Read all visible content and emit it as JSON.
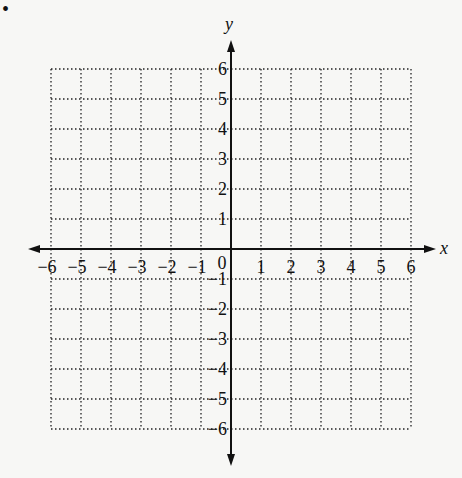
{
  "bullet": "•",
  "axes": {
    "x_label": "x",
    "y_label": "y"
  },
  "chart_data": {
    "type": "coordinate-grid",
    "title": "",
    "xlabel": "x",
    "ylabel": "y",
    "xlim": [
      -6,
      6
    ],
    "ylim": [
      -6,
      6
    ],
    "grid": "dotted",
    "x_ticks": [
      "-6",
      "-5",
      "-4",
      "-3",
      "-2",
      "-1",
      "0",
      "1",
      "2",
      "3",
      "4",
      "5",
      "6"
    ],
    "y_ticks": [
      "6",
      "5",
      "4",
      "3",
      "2",
      "1",
      "-1",
      "-2",
      "-3",
      "-4",
      "-5",
      "-6"
    ]
  },
  "x_tick_labels": [
    "−6",
    "−5",
    "−4",
    "−3",
    "−2",
    "−1",
    "1",
    "2",
    "3",
    "4",
    "5",
    "6"
  ],
  "y_tick_labels": [
    "6",
    "5",
    "4",
    "3",
    "2",
    "1",
    "−1",
    "−2",
    "−3",
    "−4",
    "−5",
    "−6"
  ],
  "origin_label": "0"
}
